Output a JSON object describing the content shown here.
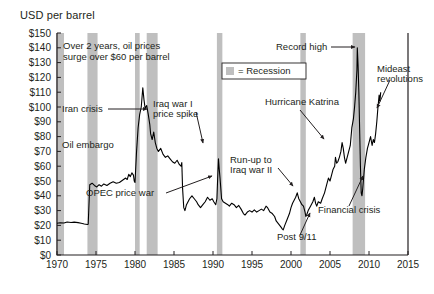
{
  "chart_data": {
    "type": "line",
    "title": "USD per barrel",
    "ylabel": "USD per barrel",
    "xlabel": "",
    "xlim": [
      1970,
      2015
    ],
    "ylim": [
      0,
      150
    ],
    "grid": false,
    "legend_position": "top-center",
    "ytick_labels": [
      "$0",
      "$10",
      "$20",
      "$30",
      "$40",
      "$50",
      "$60",
      "$70",
      "$80",
      "$90",
      "$100",
      "$110",
      "$120",
      "$130",
      "$140",
      "$150"
    ],
    "ytick_values": [
      0,
      10,
      20,
      30,
      40,
      50,
      60,
      70,
      80,
      90,
      100,
      110,
      120,
      130,
      140,
      150
    ],
    "xtick_labels": [
      "1970",
      "1975",
      "1980",
      "1985",
      "1990",
      "1995",
      "2000",
      "2005",
      "2010",
      "2015"
    ],
    "xtick_values": [
      1970,
      1975,
      1980,
      1985,
      1990,
      1995,
      2000,
      2005,
      2010,
      2015
    ],
    "legend": [
      {
        "label": "= Recession",
        "swatch_color": "#bfbfbf"
      }
    ],
    "series": [
      {
        "name": "Oil price",
        "color": "#000000",
        "points": [
          [
            1970.0,
            21.5
          ],
          [
            1970.4,
            21.8
          ],
          [
            1970.9,
            21.6
          ],
          [
            1971.3,
            22.3
          ],
          [
            1971.8,
            22.0
          ],
          [
            1972.2,
            22.2
          ],
          [
            1972.7,
            21.9
          ],
          [
            1973.1,
            21.5
          ],
          [
            1973.5,
            21.0
          ],
          [
            1973.9,
            20.6
          ],
          [
            1974.0,
            20.8
          ],
          [
            1974.2,
            47.5
          ],
          [
            1974.5,
            48.5
          ],
          [
            1974.8,
            47.0
          ],
          [
            1975.1,
            46.0
          ],
          [
            1975.4,
            47.5
          ],
          [
            1975.7,
            46.5
          ],
          [
            1976.0,
            48.0
          ],
          [
            1976.4,
            47.0
          ],
          [
            1976.8,
            48.5
          ],
          [
            1977.2,
            49.5
          ],
          [
            1977.6,
            48.5
          ],
          [
            1978.0,
            49.0
          ],
          [
            1978.4,
            50.5
          ],
          [
            1978.8,
            52.0
          ],
          [
            1979.0,
            51.0
          ],
          [
            1979.2,
            54.5
          ],
          [
            1979.4,
            53.0
          ],
          [
            1979.6,
            55.5
          ],
          [
            1979.8,
            54.0
          ],
          [
            1979.9,
            50.0
          ],
          [
            1980.0,
            49.0
          ],
          [
            1980.2,
            70.0
          ],
          [
            1980.4,
            86.0
          ],
          [
            1980.6,
            95.0
          ],
          [
            1980.8,
            100.0
          ],
          [
            1981.0,
            113.0
          ],
          [
            1981.15,
            105.0
          ],
          [
            1981.3,
            99.0
          ],
          [
            1981.5,
            101.0
          ],
          [
            1981.7,
            95.0
          ],
          [
            1981.9,
            88.0
          ],
          [
            1982.0,
            82.0
          ],
          [
            1982.2,
            78.0
          ],
          [
            1982.4,
            83.0
          ],
          [
            1982.6,
            76.0
          ],
          [
            1982.8,
            72.0
          ],
          [
            1983.0,
            70.0
          ],
          [
            1983.3,
            72.0
          ],
          [
            1983.6,
            68.0
          ],
          [
            1983.9,
            66.0
          ],
          [
            1984.2,
            67.0
          ],
          [
            1984.5,
            65.0
          ],
          [
            1984.8,
            63.0
          ],
          [
            1985.1,
            62.0
          ],
          [
            1985.4,
            64.0
          ],
          [
            1985.7,
            61.0
          ],
          [
            1985.9,
            60.0
          ],
          [
            1986.0,
            62.5
          ],
          [
            1986.1,
            45.0
          ],
          [
            1986.25,
            32.0
          ],
          [
            1986.4,
            30.0
          ],
          [
            1986.6,
            34.0
          ],
          [
            1986.8,
            36.0
          ],
          [
            1987.0,
            38.0
          ],
          [
            1987.3,
            40.0
          ],
          [
            1987.6,
            38.0
          ],
          [
            1987.9,
            36.0
          ],
          [
            1988.1,
            34.0
          ],
          [
            1988.4,
            32.0
          ],
          [
            1988.7,
            34.0
          ],
          [
            1989.0,
            36.0
          ],
          [
            1989.3,
            39.0
          ],
          [
            1989.6,
            37.0
          ],
          [
            1989.9,
            38.0
          ],
          [
            1990.1,
            36.0
          ],
          [
            1990.35,
            34.0
          ],
          [
            1990.5,
            38.0
          ],
          [
            1990.6,
            52.0
          ],
          [
            1990.7,
            65.0
          ],
          [
            1990.8,
            58.0
          ],
          [
            1990.9,
            52.0
          ],
          [
            1991.0,
            45.0
          ],
          [
            1991.1,
            38.0
          ],
          [
            1991.3,
            36.0
          ],
          [
            1991.6,
            35.0
          ],
          [
            1991.9,
            34.0
          ],
          [
            1992.1,
            33.0
          ],
          [
            1992.4,
            35.0
          ],
          [
            1992.7,
            34.0
          ],
          [
            1993.0,
            32.0
          ],
          [
            1993.3,
            33.5
          ],
          [
            1993.6,
            31.0
          ],
          [
            1993.9,
            28.0
          ],
          [
            1994.1,
            27.0
          ],
          [
            1994.4,
            29.0
          ],
          [
            1994.7,
            30.0
          ],
          [
            1995.0,
            29.0
          ],
          [
            1995.3,
            30.5
          ],
          [
            1995.6,
            29.0
          ],
          [
            1995.9,
            30.0
          ],
          [
            1996.2,
            31.0
          ],
          [
            1996.5,
            30.0
          ],
          [
            1996.8,
            33.0
          ],
          [
            1997.0,
            32.0
          ],
          [
            1997.3,
            29.0
          ],
          [
            1997.6,
            28.0
          ],
          [
            1997.9,
            26.0
          ],
          [
            1998.1,
            23.0
          ],
          [
            1998.4,
            21.0
          ],
          [
            1998.7,
            19.0
          ],
          [
            1998.9,
            17.5
          ],
          [
            1999.0,
            17.0
          ],
          [
            1999.2,
            20.0
          ],
          [
            1999.5,
            24.0
          ],
          [
            1999.8,
            28.0
          ],
          [
            2000.0,
            32.0
          ],
          [
            2000.2,
            35.0
          ],
          [
            2000.4,
            37.0
          ],
          [
            2000.6,
            39.0
          ],
          [
            2000.8,
            42.0
          ],
          [
            2000.9,
            40.0
          ],
          [
            2001.0,
            38.0
          ],
          [
            2001.2,
            36.0
          ],
          [
            2001.4,
            34.0
          ],
          [
            2001.6,
            33.0
          ],
          [
            2001.8,
            29.0
          ],
          [
            2001.9,
            26.0
          ],
          [
            2002.0,
            27.0
          ],
          [
            2002.2,
            30.0
          ],
          [
            2002.5,
            33.0
          ],
          [
            2002.8,
            36.0
          ],
          [
            2003.0,
            39.0
          ],
          [
            2003.15,
            35.0
          ],
          [
            2003.3,
            33.0
          ],
          [
            2003.5,
            36.0
          ],
          [
            2003.8,
            35.0
          ],
          [
            2004.0,
            38.0
          ],
          [
            2004.3,
            42.0
          ],
          [
            2004.6,
            48.0
          ],
          [
            2004.8,
            52.0
          ],
          [
            2005.0,
            50.0
          ],
          [
            2005.2,
            54.0
          ],
          [
            2005.4,
            58.0
          ],
          [
            2005.6,
            60.0
          ],
          [
            2005.7,
            66.0
          ],
          [
            2005.85,
            62.0
          ],
          [
            2006.0,
            63.0
          ],
          [
            2006.2,
            66.0
          ],
          [
            2006.4,
            70.0
          ],
          [
            2006.55,
            76.0
          ],
          [
            2006.7,
            72.0
          ],
          [
            2006.85,
            66.0
          ],
          [
            2007.0,
            62.0
          ],
          [
            2007.2,
            66.0
          ],
          [
            2007.4,
            70.0
          ],
          [
            2007.6,
            74.0
          ],
          [
            2007.8,
            86.0
          ],
          [
            2008.0,
            92.0
          ],
          [
            2008.15,
            100.0
          ],
          [
            2008.3,
            110.0
          ],
          [
            2008.45,
            125.0
          ],
          [
            2008.5,
            140.0
          ],
          [
            2008.6,
            128.0
          ],
          [
            2008.7,
            110.0
          ],
          [
            2008.8,
            85.0
          ],
          [
            2008.9,
            60.0
          ],
          [
            2009.0,
            42.0
          ],
          [
            2009.1,
            40.0
          ],
          [
            2009.2,
            45.0
          ],
          [
            2009.4,
            58.0
          ],
          [
            2009.6,
            66.0
          ],
          [
            2009.8,
            72.0
          ],
          [
            2010.0,
            76.0
          ],
          [
            2010.2,
            80.0
          ],
          [
            2010.4,
            74.0
          ],
          [
            2010.55,
            78.0
          ],
          [
            2010.7,
            76.0
          ],
          [
            2010.85,
            82.0
          ],
          [
            2011.0,
            90.0
          ],
          [
            2011.15,
            100.0
          ],
          [
            2011.3,
            108.0
          ],
          [
            2011.4,
            104.0
          ],
          [
            2011.5,
            110.0
          ]
        ]
      }
    ],
    "recession_bands": [
      {
        "start": 1969.9,
        "end": 1970.9
      },
      {
        "start": 1973.9,
        "end": 1975.2
      },
      {
        "start": 1980.0,
        "end": 1980.6
      },
      {
        "start": 1981.5,
        "end": 1982.9
      },
      {
        "start": 1990.5,
        "end": 1991.2
      },
      {
        "start": 2001.2,
        "end": 2001.9
      },
      {
        "start": 2007.9,
        "end": 2009.5
      }
    ],
    "annotations": [
      {
        "id": "surge",
        "text_lines": [
          "Over 2 years, oil prices",
          "surge over $60 per barrel"
        ]
      },
      {
        "id": "iran-crisis",
        "text_lines": [
          "Iran crisis"
        ]
      },
      {
        "id": "oil-embargo",
        "text_lines": [
          "Oil embargo"
        ]
      },
      {
        "id": "opec-price-war",
        "text_lines": [
          "OPEC price war"
        ]
      },
      {
        "id": "iraq-war-1",
        "text_lines": [
          "Iraq war I",
          "price spike"
        ]
      },
      {
        "id": "post-911",
        "text_lines": [
          "Post 9/11"
        ]
      },
      {
        "id": "run-up-iraq-2",
        "text_lines": [
          "Run-up to",
          "Iraq war II"
        ]
      },
      {
        "id": "hurricane-katrina",
        "text_lines": [
          "Hurricane Katrina"
        ]
      },
      {
        "id": "record-high",
        "text_lines": [
          "Record high"
        ]
      },
      {
        "id": "financial-crisis",
        "text_lines": [
          "Financial crisis"
        ]
      },
      {
        "id": "mideast-revolutions",
        "text_lines": [
          "Mideast",
          "revolutions"
        ]
      }
    ]
  }
}
